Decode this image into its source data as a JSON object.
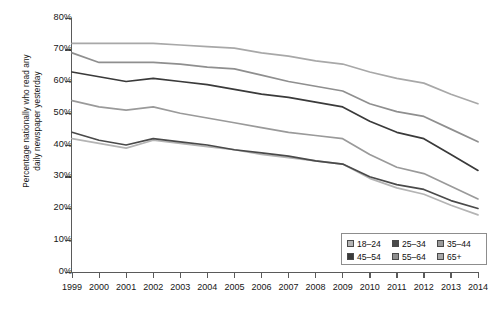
{
  "chart_data": {
    "type": "line",
    "title": "",
    "xlabel": "",
    "ylabel": "Percentage nationally who read any daily newspaper yesterday",
    "x": [
      1999,
      2000,
      2001,
      2002,
      2003,
      2004,
      2005,
      2006,
      2007,
      2008,
      2009,
      2010,
      2011,
      2012,
      2013,
      2014
    ],
    "xlim": [
      1999,
      2014
    ],
    "ylim": [
      0,
      80
    ],
    "ytick_labels": [
      "0%",
      "10%",
      "20%",
      "30%",
      "40%",
      "50%",
      "60%",
      "70%",
      "80%"
    ],
    "ytick_values": [
      0,
      10,
      20,
      30,
      40,
      50,
      60,
      70,
      80
    ],
    "xtick_labels": [
      "1999",
      "2000",
      "2001",
      "2002",
      "2003",
      "2004",
      "2005",
      "2006",
      "2007",
      "2008",
      "2009",
      "2010",
      "2011",
      "2012",
      "2013",
      "2014"
    ],
    "grid": false,
    "legend_position": "bottom-right",
    "series": [
      {
        "name": "18–24",
        "color": "#b4b4b4",
        "values": [
          42.0,
          40.5,
          39.0,
          41.5,
          40.5,
          39.5,
          38.5,
          37.0,
          36.0,
          35.0,
          34.0,
          29.5,
          26.5,
          24.5,
          21.0,
          18.0
        ]
      },
      {
        "name": "25–34",
        "color": "#4a4a4a",
        "values": [
          44.0,
          41.5,
          40.0,
          42.0,
          41.0,
          40.0,
          38.5,
          37.5,
          36.5,
          35.0,
          34.0,
          30.0,
          27.5,
          26.0,
          22.5,
          20.0
        ]
      },
      {
        "name": "35–44",
        "color": "#9a9a9a",
        "values": [
          54.0,
          52.0,
          51.0,
          52.0,
          50.0,
          48.5,
          47.0,
          45.5,
          44.0,
          43.0,
          42.0,
          37.0,
          33.0,
          31.0,
          27.0,
          23.0
        ]
      },
      {
        "name": "45–54",
        "color": "#3a3a3a",
        "values": [
          63.0,
          61.5,
          60.0,
          61.0,
          60.0,
          59.0,
          57.5,
          56.0,
          55.0,
          53.5,
          52.0,
          47.5,
          44.0,
          42.0,
          37.0,
          32.0
        ]
      },
      {
        "name": "55–64",
        "color": "#8f8f8f",
        "values": [
          69.0,
          66.0,
          66.0,
          66.0,
          65.5,
          64.5,
          64.0,
          62.0,
          60.0,
          58.5,
          57.0,
          53.0,
          50.5,
          49.0,
          45.0,
          41.0
        ]
      },
      {
        "name": "65+",
        "color": "#a8a8a8",
        "values": [
          72.0,
          72.0,
          72.0,
          72.0,
          71.5,
          71.0,
          70.5,
          69.0,
          68.0,
          66.5,
          65.5,
          63.0,
          61.0,
          59.5,
          56.0,
          53.0
        ]
      }
    ]
  },
  "legend": {
    "rows": [
      [
        {
          "label": "18–24",
          "color": "#b4b4b4"
        },
        {
          "label": "25–34",
          "color": "#4a4a4a"
        },
        {
          "label": "35–44",
          "color": "#9a9a9a"
        }
      ],
      [
        {
          "label": "45–54",
          "color": "#3a3a3a"
        },
        {
          "label": "55–64",
          "color": "#8f8f8f"
        },
        {
          "label": "65+",
          "color": "#a8a8a8"
        }
      ]
    ]
  },
  "axis_title": {
    "line1": "Percentage nationally who read any",
    "line2": "daily newspaper yesterday"
  }
}
